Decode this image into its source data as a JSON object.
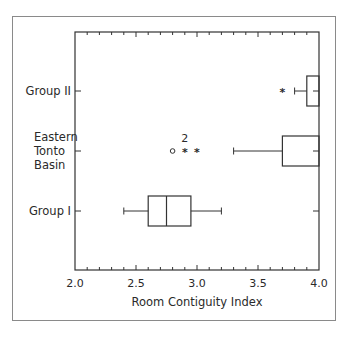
{
  "chart_data": {
    "type": "boxplot",
    "orientation": "horizontal",
    "title": "",
    "xlabel": "Room Contiguity Index",
    "ylabel": "",
    "xlim": [
      2.0,
      4.0
    ],
    "x_ticks": [
      "2.0",
      "2.5",
      "3.0",
      "3.5",
      "4.0"
    ],
    "x_minor_tick_step": 0.1,
    "categories": [
      "Group II",
      "Eastern Tonto Basin",
      "Group I"
    ],
    "category_label_lines": [
      [
        "Group II"
      ],
      [
        "Eastern",
        "Tonto",
        "Basin"
      ],
      [
        "Group I"
      ]
    ],
    "series": [
      {
        "name": "Group II",
        "whisker_low": 3.8,
        "q1": 3.9,
        "median": 4.0,
        "q3": 4.0,
        "whisker_high": 4.0,
        "outliers": [
          {
            "value": 3.7,
            "marker": "star",
            "count": 1
          }
        ]
      },
      {
        "name": "Eastern Tonto Basin",
        "whisker_low": 3.3,
        "q1": 3.7,
        "median": 4.0,
        "q3": 4.0,
        "whisker_high": 4.0,
        "outliers": [
          {
            "value": 2.8,
            "marker": "circle",
            "count": 1
          },
          {
            "value": 2.9,
            "marker": "star",
            "count": 2,
            "annotation": "2"
          },
          {
            "value": 3.0,
            "marker": "star",
            "count": 1
          }
        ]
      },
      {
        "name": "Group I",
        "whisker_low": 2.4,
        "q1": 2.6,
        "median": 2.75,
        "q3": 2.95,
        "whisker_high": 3.2,
        "outliers": []
      }
    ],
    "legend": null,
    "grid": false
  }
}
